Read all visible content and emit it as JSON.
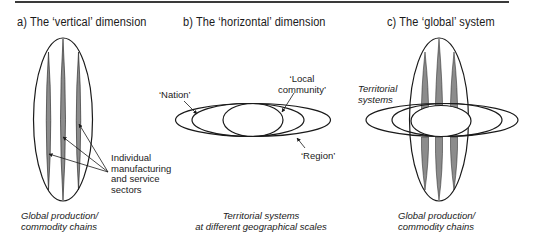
{
  "panels": {
    "a": {
      "title": "a) The ‘vertical’ dimension",
      "callout": [
        "Individual",
        "manufacturing",
        "and service",
        "sectors"
      ],
      "caption": [
        "Global production/",
        "commodity chains"
      ]
    },
    "b": {
      "title": "b) The ‘horizontal’ dimension",
      "labels": {
        "nation": "‘Nation’",
        "local_community": [
          "‘Local",
          "community’"
        ],
        "region": "‘Region’"
      },
      "caption": [
        "Territorial systems",
        "at different geographical scales"
      ]
    },
    "c": {
      "title": "c) The ‘global’ system",
      "label": [
        "Territorial",
        "systems"
      ],
      "caption": [
        "Global production/",
        "commodity chains"
      ]
    }
  },
  "colors": {
    "stroke": "#1a1a1a",
    "stripe_fill": "#8c8c8c",
    "rule": "#3a3a3a",
    "background": "#ffffff"
  }
}
